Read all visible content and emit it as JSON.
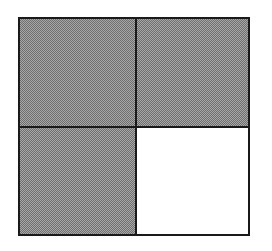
{
  "diagram": {
    "type": "fraction-grid",
    "rows": 2,
    "cols": 2,
    "cells": [
      {
        "position": "top-left",
        "state": "shaded"
      },
      {
        "position": "top-right",
        "state": "shaded"
      },
      {
        "position": "bottom-left",
        "state": "shaded"
      },
      {
        "position": "bottom-right",
        "state": "unshaded"
      }
    ],
    "shaded_count": 3,
    "total_count": 4,
    "colors": {
      "shaded": "#8a8a8a",
      "unshaded": "#ffffff",
      "border": "#1a1a1a"
    }
  }
}
